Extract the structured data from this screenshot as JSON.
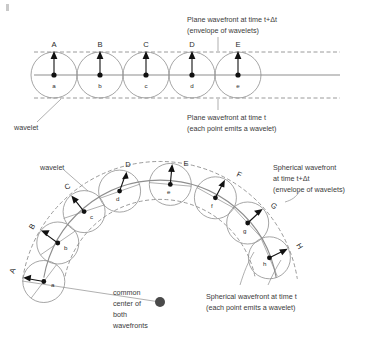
{
  "figure": {
    "title_hidden": "Huygens principle: plane and spherical wavefronts",
    "colors": {
      "wavelet_stroke": "#8e8e8e",
      "wavefront_stroke": "#8e8e8e",
      "ray_arrow": "#111111",
      "text": "#3a3a3a",
      "center_dot": "#4a4a4a"
    }
  },
  "upper_panel": {
    "caption_top_line1": "Plane wavefront at time t+Δt",
    "caption_top_line2": "(envelope of wavelets)",
    "caption_bottom_line1": "Plane wavefront at time t",
    "caption_bottom_line2": "(each point emits a wavelet)",
    "wavelet_label": "wavelet",
    "source_points": [
      "a",
      "b",
      "c",
      "d",
      "e"
    ],
    "envelope_points": [
      "A",
      "B",
      "C",
      "D",
      "E"
    ]
  },
  "lower_panel": {
    "caption_right_top_line1": "Spherical wavefront",
    "caption_right_top_line2": "at time t+Δt",
    "caption_right_top_line3": "(envelope of wavelets)",
    "caption_right_bottom_line1": "Spherical wavefront at time t",
    "caption_right_bottom_line2": "(each point emits a wavelet)",
    "wavelet_label": "wavelet",
    "center_label_line1": "common",
    "center_label_line2": "center of",
    "center_label_line3": "both",
    "center_label_line4": "wavefronts",
    "source_points": [
      "a",
      "b",
      "c",
      "d",
      "e",
      "f",
      "g",
      "h"
    ],
    "envelope_points": [
      "A",
      "B",
      "C",
      "D",
      "E",
      "F",
      "G",
      "H"
    ]
  }
}
